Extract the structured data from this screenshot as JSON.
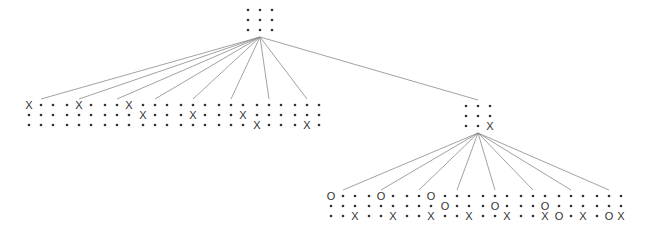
{
  "diagram": {
    "type": "game-tree",
    "game": "tic-tac-toe",
    "empty_symbol": "•",
    "layout": {
      "cell_dx": 12,
      "cell_dy": 10,
      "board_spacing": 38
    },
    "root": {
      "cells": [
        "",
        "",
        "",
        "",
        "",
        "",
        "",
        "",
        ""
      ],
      "origin": [
        248,
        10
      ]
    },
    "level1": {
      "origin_y": 105,
      "left_group": {
        "start_x": 29,
        "boards": [
          [
            "X",
            "",
            "",
            "",
            "",
            "",
            "",
            "",
            ""
          ],
          [
            "",
            "X",
            "",
            "",
            "",
            "",
            "",
            "",
            ""
          ],
          [
            "",
            "",
            "X",
            "",
            "",
            "",
            "",
            "",
            ""
          ],
          [
            "",
            "",
            "",
            "X",
            "",
            "",
            "",
            "",
            ""
          ],
          [
            "",
            "",
            "",
            "",
            "X",
            "",
            "",
            "",
            ""
          ],
          [
            "",
            "",
            "",
            "",
            "",
            "X",
            "",
            "",
            ""
          ],
          [
            "",
            "",
            "",
            "",
            "",
            "",
            "X",
            "",
            ""
          ],
          [
            "",
            "",
            "",
            "",
            "",
            "",
            "",
            "X",
            ""
          ]
        ]
      },
      "expanded": {
        "cells": [
          "",
          "",
          "",
          "",
          "",
          "",
          "",
          "",
          "X"
        ],
        "origin": [
          466,
          106
        ]
      }
    },
    "level2": {
      "origin_y": 196,
      "start_x": 331,
      "boards": [
        [
          "O",
          "",
          "",
          "",
          "",
          "",
          "",
          "",
          "X"
        ],
        [
          "",
          "O",
          "",
          "",
          "",
          "",
          "",
          "",
          "X"
        ],
        [
          "",
          "",
          "O",
          "",
          "",
          "",
          "",
          "",
          "X"
        ],
        [
          "",
          "",
          "",
          "O",
          "",
          "",
          "",
          "",
          "X"
        ],
        [
          "",
          "",
          "",
          "",
          "O",
          "",
          "",
          "",
          "X"
        ],
        [
          "",
          "",
          "",
          "",
          "",
          "O",
          "",
          "",
          "X"
        ],
        [
          "",
          "",
          "",
          "",
          "",
          "",
          "O",
          "",
          "X"
        ],
        [
          "",
          "",
          "",
          "",
          "",
          "",
          "",
          "O",
          "X"
        ]
      ]
    }
  }
}
